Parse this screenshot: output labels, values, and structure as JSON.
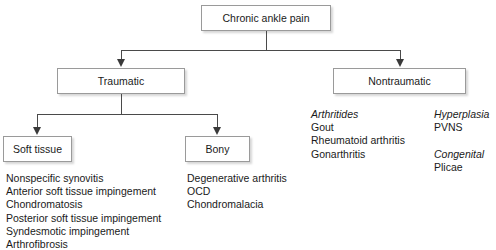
{
  "diagram": {
    "colors": {
      "box_border": "#9a9a9a",
      "connector": "#4a4a4a",
      "arrowhead": "#3a3a3a",
      "text": "#1a1a1a",
      "background": "#ffffff"
    },
    "nodes": {
      "root": "Chronic ankle pain",
      "traumatic": "Traumatic",
      "nontraumatic": "Nontraumatic",
      "soft_tissue": "Soft tissue",
      "bony": "Bony"
    },
    "lists": {
      "soft_tissue_items": [
        "Nonspecific synovitis",
        "Anterior soft tissue impingement",
        "Chondromatosis",
        "Posterior soft tissue impingement",
        "Syndesmotic impingement",
        "Arthrofibrosis"
      ],
      "bony_items": [
        "Degenerative arthritis",
        "OCD",
        "Chondromalacia"
      ],
      "nontraumatic_col1": {
        "heading": "Arthritides",
        "items": [
          "Gout",
          "Rheumatoid arthritis",
          "Gonarthritis"
        ]
      },
      "nontraumatic_col2_group1": {
        "heading": "Hyperplasia",
        "items": [
          "PVNS"
        ]
      },
      "nontraumatic_col2_group2": {
        "heading": "Congenital",
        "items": [
          "Plicae"
        ]
      }
    }
  }
}
